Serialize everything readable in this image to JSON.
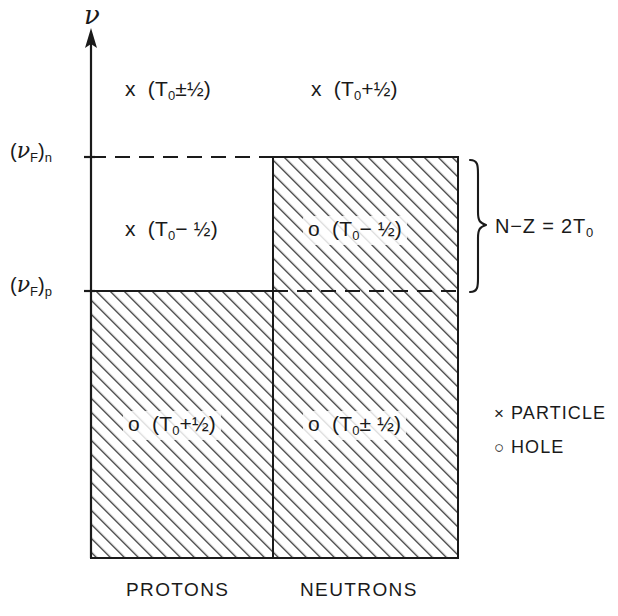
{
  "figure": {
    "domain": "physics-diagram",
    "background_color": "#ffffff",
    "line_color": "#1a1a1a",
    "hatch_color": "#333333"
  },
  "axis": {
    "vertical_label": "ν",
    "arrow": "up-arrow"
  },
  "fermi_levels": [
    {
      "id": "neutron-fermi",
      "nu": "ν",
      "sub_f": "F",
      "sub_species": "n",
      "text": "(ν_F)_n",
      "y": 157
    },
    {
      "id": "proton-fermi",
      "nu": "ν",
      "sub_f": "F",
      "sub_species": "p",
      "text": "(ν_F)_p",
      "y": 291
    }
  ],
  "cells": [
    {
      "id": "proton-particle",
      "column": "protons",
      "region": "above-neutron-fermi",
      "marker": "x",
      "marker_meaning": "particle",
      "isospin": "(T₀±½)",
      "t_symbol": "T",
      "t_sub": "0",
      "sign": "±",
      "fraction": "½",
      "filled": false
    },
    {
      "id": "neutron-particle",
      "column": "neutrons",
      "region": "above-neutron-fermi",
      "marker": "x",
      "marker_meaning": "particle",
      "isospin": "(T₀+½)",
      "t_symbol": "T",
      "t_sub": "0",
      "sign": "+",
      "fraction": "½",
      "filled": false
    },
    {
      "id": "proton-particle-mid",
      "column": "protons",
      "region": "between-fermi-levels",
      "marker": "x",
      "marker_meaning": "particle",
      "isospin": "(T₀−½)",
      "t_symbol": "T",
      "t_sub": "0",
      "sign": "−",
      "fraction": "½",
      "filled": false
    },
    {
      "id": "neutron-hole-mid",
      "column": "neutrons",
      "region": "between-fermi-levels",
      "marker": "o",
      "marker_meaning": "hole",
      "isospin": "(T₀−½)",
      "t_symbol": "T",
      "t_sub": "0",
      "sign": "−",
      "fraction": "½",
      "filled": true
    },
    {
      "id": "proton-hole",
      "column": "protons",
      "region": "below-proton-fermi",
      "marker": "o",
      "marker_meaning": "hole",
      "isospin": "(T₀+½)",
      "t_symbol": "T",
      "t_sub": "0",
      "sign": "+",
      "fraction": "½",
      "filled": true
    },
    {
      "id": "neutron-hole",
      "column": "neutrons",
      "region": "below-proton-fermi",
      "marker": "o",
      "marker_meaning": "hole",
      "isospin": "(T₀±½)",
      "t_symbol": "T",
      "t_sub": "0",
      "sign": "±",
      "fraction": "½",
      "filled": true
    }
  ],
  "brace_annotation": {
    "n_symbol": "N",
    "minus": "−",
    "z_symbol": "Z",
    "equals": "=",
    "value": "2",
    "t_symbol": "T",
    "t_sub": "0",
    "full_text": "N−Z = 2T₀"
  },
  "legend": {
    "items": [
      {
        "glyph": "×",
        "glyph_name": "cross-marker",
        "label": "PARTICLE"
      },
      {
        "glyph": "○",
        "glyph_name": "circle-marker",
        "label": "HOLE"
      }
    ]
  },
  "column_labels": [
    {
      "id": "protons",
      "label": "PROTONS"
    },
    {
      "id": "neutrons",
      "label": "NEUTRONS"
    }
  ]
}
